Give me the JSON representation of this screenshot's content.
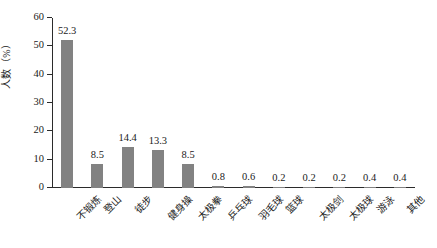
{
  "chart_data": {
    "type": "bar",
    "title": "",
    "xlabel": "",
    "ylabel": "人数（%）",
    "ylim": [
      0,
      60
    ],
    "yticks": [
      0,
      10,
      20,
      30,
      40,
      50,
      60
    ],
    "grid": false,
    "legend": null,
    "bar_color": "#828282",
    "axis_color": "#2b2b2b",
    "categories": [
      "不锻炼",
      "登山",
      "徒步",
      "健身操",
      "太极拳",
      "乒乓球",
      "羽毛球",
      "篮球",
      "太极剑",
      "太极球",
      "游泳",
      "其他"
    ],
    "values": [
      52.3,
      8.5,
      14.4,
      13.3,
      8.5,
      0.8,
      0.6,
      0.2,
      0.2,
      0.2,
      0.4,
      0.4
    ],
    "value_labels": [
      "52.3",
      "8.5",
      "14.4",
      "13.3",
      "8.5",
      "0.8",
      "0.6",
      "0.2",
      "0.2",
      "0.2",
      "0.4",
      "0.4"
    ],
    "ytick_labels": [
      "0",
      "10",
      "20",
      "30",
      "40",
      "50",
      "60"
    ]
  }
}
